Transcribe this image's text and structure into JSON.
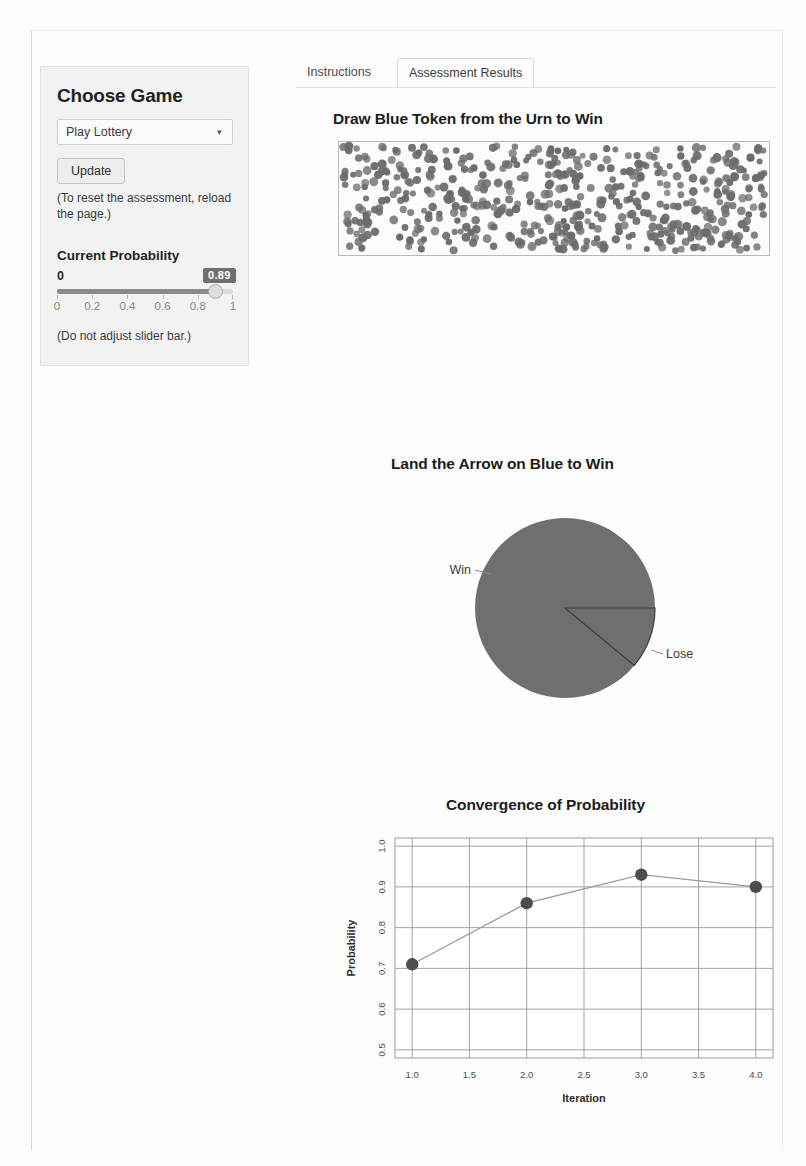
{
  "sidebar": {
    "heading": "Choose Game",
    "game_select": {
      "value": "Play Lottery",
      "caret": "chevron-down-icon"
    },
    "update_label": "Update",
    "reset_note": "(To reset the assessment, reload the page.)",
    "probability_heading": "Current Probability",
    "slider": {
      "min_label": "0",
      "value_label": "0.89",
      "value": 0.89,
      "min": 0,
      "max": 1,
      "ticks": [
        "0",
        "0.2",
        "0.4",
        "0.6",
        "0.8",
        "1"
      ]
    },
    "slider_note": "(Do not adjust slider bar.)"
  },
  "tabs": [
    {
      "label": "Instructions",
      "active": false
    },
    {
      "label": "Assessment Results",
      "active": true
    }
  ],
  "urn": {
    "title": "Draw Blue Token from the Urn to Win",
    "token_color": "#6b6b6b",
    "token_count": 520,
    "background": "#fcfcfc"
  },
  "spinner": {
    "title": "Land the Arrow on Blue to Win",
    "win_label": "Win",
    "lose_label": "Lose",
    "win_fraction": 0.89,
    "lose_fraction": 0.11,
    "wedge_color": "#6f6f6f"
  },
  "chart_data": {
    "type": "line",
    "title": "Convergence of Probability",
    "xlabel": "Iteration",
    "ylabel": "Probability",
    "x": [
      1.0,
      2.0,
      3.0,
      4.0
    ],
    "values": [
      0.71,
      0.86,
      0.93,
      0.9
    ],
    "xticks": [
      "1.0",
      "1.5",
      "2.0",
      "2.5",
      "3.0",
      "3.5",
      "4.0"
    ],
    "xtick_values": [
      1.0,
      1.5,
      2.0,
      2.5,
      3.0,
      3.5,
      4.0
    ],
    "yticks": [
      "0.5",
      "0.6",
      "0.7",
      "0.8",
      "0.9",
      "1.0"
    ],
    "ytick_values": [
      0.5,
      0.6,
      0.7,
      0.8,
      0.9,
      1.0
    ],
    "xlim": [
      0.85,
      4.15
    ],
    "ylim": [
      0.48,
      1.02
    ],
    "grid": true,
    "legend": "none",
    "marker_color": "#4d4d4d",
    "line_color": "#9a9a9a"
  }
}
